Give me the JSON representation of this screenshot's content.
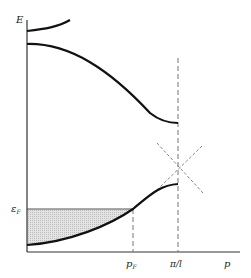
{
  "diagram": {
    "axes": {
      "y_label": "E",
      "x_label": "p"
    },
    "markers": {
      "fermi_energy_label": "ε",
      "fermi_energy_sub": "F",
      "fermi_momentum_label": "p",
      "fermi_momentum_sub": "F",
      "zone_boundary_label": "π/l"
    },
    "curves": [
      {
        "name": "upper-band-top",
        "description": "third band rising from E axis"
      },
      {
        "name": "upper-band",
        "description": "second band decreasing to zone boundary"
      },
      {
        "name": "lower-band",
        "description": "first band rising to zone boundary"
      }
    ],
    "shaded_region": "occupied states below Fermi level",
    "colors": {
      "line": "#111111",
      "dashed": "#777777",
      "fill": "#d6d6d6"
    }
  }
}
